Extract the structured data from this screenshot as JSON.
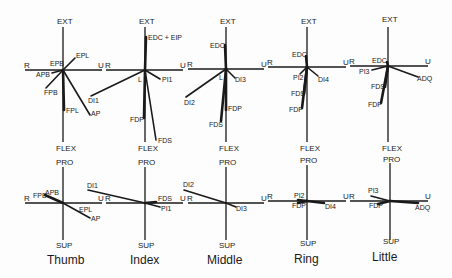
{
  "figure": {
    "axis_labels": {
      "top_panel": {
        "up": "EXT",
        "down": "FLEX",
        "left": "R",
        "right": "U"
      },
      "bottom_panel": {
        "up": "PRO",
        "down": "SUP",
        "left": "R",
        "right": "U"
      }
    },
    "fingers": [
      {
        "name": "Thumb",
        "top_muscles": [
          "EPL",
          "EPB",
          "APB",
          "FPB",
          "FPL",
          "AP"
        ],
        "bottom_muscles": [
          "FPB",
          "APB",
          "EPL",
          "AP"
        ]
      },
      {
        "name": "Index",
        "top_muscles": [
          "EDC + EIP",
          "L",
          "PI1",
          "DI1",
          "FDP",
          "FDS"
        ],
        "bottom_muscles": [
          "DI1",
          "FDS",
          "PI1"
        ]
      },
      {
        "name": "Middle",
        "top_muscles": [
          "EDC",
          "L",
          "DI3",
          "DI2",
          "FDP",
          "FDS"
        ],
        "bottom_muscles": [
          "DI2",
          "DI3"
        ]
      },
      {
        "name": "Ring",
        "top_muscles": [
          "EDC",
          "PI2",
          "DI4",
          "FDS",
          "FDP"
        ],
        "bottom_muscles": [
          "PI2",
          "FDP",
          "DI4"
        ]
      },
      {
        "name": "Little",
        "top_muscles": [
          "EDC",
          "PI3",
          "ADQ",
          "FDS",
          "FDP"
        ],
        "bottom_muscles": [
          "PI3",
          "FDP",
          "ADQ"
        ]
      }
    ]
  }
}
